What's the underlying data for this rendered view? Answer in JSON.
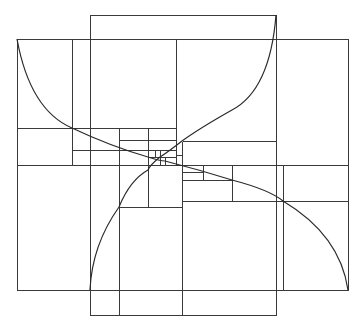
{
  "diagram": {
    "title": "",
    "type": "double golden spiral with nested golden rectangles",
    "stroke_color": "#3a3a3a",
    "background": "#ffffff",
    "rectangles": [
      {
        "name": "outer-horizontal-rect",
        "x": 17,
        "y": 39,
        "w": 331,
        "h": 251
      },
      {
        "name": "outer-vertical-rect",
        "x": 90,
        "y": 15,
        "w": 186,
        "h": 300
      }
    ],
    "lines": [
      {
        "x1": 72,
        "y1": 39,
        "x2": 72,
        "y2": 165
      },
      {
        "x1": 17,
        "y1": 128,
        "x2": 176,
        "y2": 128
      },
      {
        "x1": 176,
        "y1": 39,
        "x2": 176,
        "y2": 165
      },
      {
        "x1": 182,
        "y1": 141,
        "x2": 182,
        "y2": 315
      },
      {
        "x1": 90,
        "y1": 39,
        "x2": 276,
        "y2": 39
      },
      {
        "x1": 17,
        "y1": 165,
        "x2": 348,
        "y2": 165
      },
      {
        "x1": 90,
        "y1": 290,
        "x2": 276,
        "y2": 290
      },
      {
        "x1": 182,
        "y1": 141,
        "x2": 276,
        "y2": 141
      },
      {
        "x1": 119,
        "y1": 128,
        "x2": 119,
        "y2": 315
      },
      {
        "x1": 72,
        "y1": 150,
        "x2": 176,
        "y2": 150
      },
      {
        "x1": 119,
        "y1": 140,
        "x2": 176,
        "y2": 140
      },
      {
        "x1": 148,
        "y1": 128,
        "x2": 148,
        "y2": 165
      },
      {
        "x1": 119,
        "y1": 207,
        "x2": 182,
        "y2": 207
      },
      {
        "x1": 148,
        "y1": 165,
        "x2": 148,
        "y2": 207
      },
      {
        "x1": 283,
        "y1": 165,
        "x2": 283,
        "y2": 290
      },
      {
        "x1": 182,
        "y1": 201,
        "x2": 348,
        "y2": 201
      },
      {
        "x1": 182,
        "y1": 180,
        "x2": 232,
        "y2": 180
      },
      {
        "x1": 232,
        "y1": 165,
        "x2": 232,
        "y2": 201
      },
      {
        "x1": 203,
        "y1": 165,
        "x2": 203,
        "y2": 180
      },
      {
        "x1": 182,
        "y1": 172,
        "x2": 203,
        "y2": 172
      },
      {
        "x1": 176,
        "y1": 155,
        "x2": 182,
        "y2": 155
      },
      {
        "x1": 160,
        "y1": 150,
        "x2": 160,
        "y2": 165
      },
      {
        "x1": 148,
        "y1": 157,
        "x2": 176,
        "y2": 157
      },
      {
        "x1": 165,
        "y1": 157,
        "x2": 165,
        "y2": 165
      },
      {
        "x1": 155,
        "y1": 150,
        "x2": 155,
        "y2": 157
      }
    ],
    "spirals": [
      {
        "name": "spiral-top-left-to-bottom-right",
        "path": "M17,39 Q30,110 72,128 Q110,146 148,157 Q160,161 165,161 Q200,170 232,180 Q270,190 283,201 Q340,235 348,290"
      },
      {
        "name": "spiral-top-right-to-bottom-left",
        "path": "M276,15 Q270,90 232,110 Q200,128 182,141 Q168,152 160,157 Q150,165 148,170 Q130,180 119,207 Q92,245 90,290"
      }
    ],
    "center_point": {
      "x": 157,
      "y": 160
    }
  }
}
